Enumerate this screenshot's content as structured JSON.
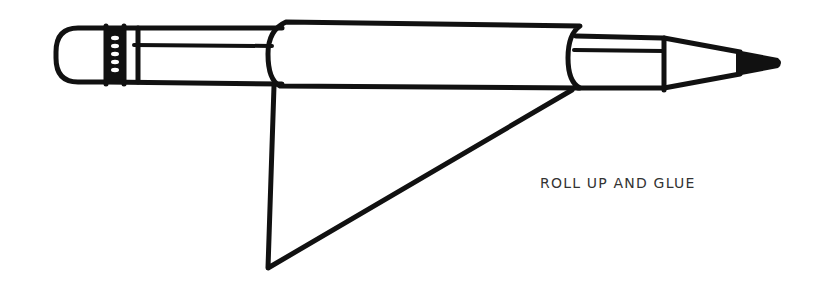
{
  "diagram": {
    "instruction_label": "ROLL UP AND GLUE",
    "colors": {
      "line": "#111111",
      "text": "#333333",
      "background": "#ffffff"
    },
    "parts": [
      "eraser",
      "ferrule",
      "barrel",
      "rolled-body",
      "front-sleeve",
      "sharpened-tip",
      "graphite-point",
      "glue-flap-triangle"
    ]
  }
}
